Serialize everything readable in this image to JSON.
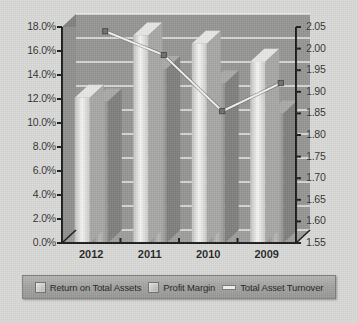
{
  "chart_data": {
    "type": "bar",
    "title": "",
    "subtitle": "",
    "xlabel": "",
    "ylabel": "",
    "y2label": "",
    "grid": true,
    "legend_position": "bottom",
    "categories": [
      "2012",
      "2011",
      "2010",
      "2009"
    ],
    "series": [
      {
        "name": "Return on Total Assets",
        "axis": "left",
        "kind": "bar",
        "values": [
          11.8,
          14.5,
          13.3,
          10.8
        ],
        "color": "#9a9a98"
      },
      {
        "name": "Profit Margin",
        "axis": "left",
        "kind": "bar",
        "values": [
          12.1,
          17.3,
          16.6,
          15.1
        ],
        "color": "#dcdcda"
      },
      {
        "name": "Total Asset Turnover",
        "axis": "right",
        "kind": "line",
        "values": [
          2.01,
          1.955,
          1.825,
          1.89
        ],
        "color": "#f0f0ee"
      }
    ],
    "yaxis_left": {
      "min": 0.0,
      "max": 18.0,
      "step": 2.0,
      "ticks": [
        "0.0%",
        "2.0%",
        "4.0%",
        "6.0%",
        "8.0%",
        "10.0%",
        "12.0%",
        "14.0%",
        "16.0%",
        "18.0%"
      ]
    },
    "yaxis_right": {
      "min": 1.55,
      "max": 2.05,
      "step": 0.05,
      "ticks": [
        "1.55",
        "1.60",
        "1.65",
        "1.70",
        "1.75",
        "1.80",
        "1.85",
        "1.90",
        "1.95",
        "2.00",
        "2.05"
      ]
    }
  },
  "legend": {
    "items": [
      {
        "label": "Return on Total Assets",
        "marker": "swatch-dark"
      },
      {
        "label": "Profit Margin",
        "marker": "swatch-light"
      },
      {
        "label": "Total Asset Turnover",
        "marker": "line"
      }
    ]
  },
  "colors": {
    "background": "#d8d8d6",
    "plot_wall": "#8e8e8c",
    "plot_floor": "#9c9c9a",
    "axis": "#1a1a1a",
    "gridline": "#f2f2f0",
    "bar_light": "#dcdcda",
    "bar_dark": "#9a9a98",
    "line": "#f0f0ee",
    "legend_bg": "#a6a6a4"
  }
}
